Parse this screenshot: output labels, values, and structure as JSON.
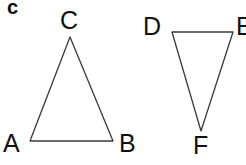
{
  "figure": {
    "part_label": "c",
    "background_color": "#ffffff",
    "stroke_color": "#3a3a3a",
    "label_color": "#111111",
    "stroke_width": 1.3,
    "width": 246,
    "height": 165,
    "shapes": [
      {
        "name": "triangle-abc",
        "type": "triangle",
        "orientation": "upright",
        "points": "70,37 30,141 113,141",
        "vertices": [
          {
            "label": "A",
            "x": 30,
            "y": 141
          },
          {
            "label": "B",
            "x": 113,
            "y": 141
          },
          {
            "label": "C",
            "x": 70,
            "y": 37
          }
        ]
      },
      {
        "name": "triangle-def",
        "type": "triangle",
        "orientation": "inverted",
        "points": "172,32 233,32 201,131",
        "vertices": [
          {
            "label": "D",
            "x": 172,
            "y": 32
          },
          {
            "label": "E",
            "x": 233,
            "y": 32
          },
          {
            "label": "F",
            "x": 201,
            "y": 131
          }
        ]
      }
    ],
    "labels": [
      {
        "name": "vertex-label-c",
        "text": "C",
        "left": 60,
        "top": 8
      },
      {
        "name": "vertex-label-a",
        "text": "A",
        "left": 3,
        "top": 131
      },
      {
        "name": "vertex-label-b",
        "text": "B",
        "left": 119,
        "top": 131
      },
      {
        "name": "vertex-label-d",
        "text": "D",
        "left": 143,
        "top": 14
      },
      {
        "name": "vertex-label-e",
        "text": "E",
        "left": 236,
        "top": 14
      },
      {
        "name": "vertex-label-f",
        "text": "F",
        "left": 193,
        "top": 133
      }
    ]
  }
}
